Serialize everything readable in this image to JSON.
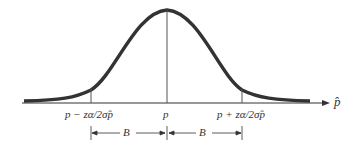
{
  "diagram": {
    "type": "normal-distribution-curve",
    "axis_label": "p̂",
    "center_label": "p",
    "left_bound_label": "p − zα/2σp̂",
    "right_bound_label": "p + zα/2σp̂",
    "left_interval_label": "B",
    "right_interval_label": "B"
  }
}
